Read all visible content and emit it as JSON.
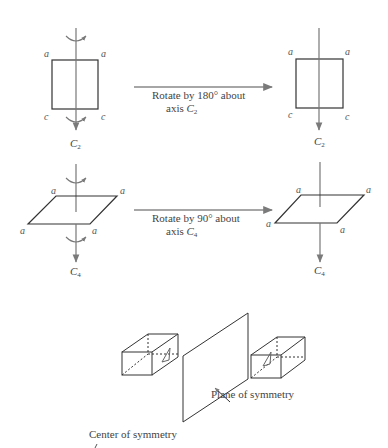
{
  "figure": {
    "c2_row": {
      "before_labels": {
        "top_left": "a",
        "top_right": "a",
        "bottom_left": "c",
        "bottom_right": "c"
      },
      "after_labels": {
        "top_left": "a",
        "top_right": "a",
        "bottom_left": "c",
        "bottom_right": "c"
      },
      "arrow_caption_line1": "Rotate by 180° about",
      "arrow_caption_line2_prefix": "axis ",
      "axis_name": "C",
      "axis_subscript": "2"
    },
    "c4_row": {
      "before_labels": {
        "top_left": "a",
        "top_right": "a",
        "bottom_left": "a",
        "bottom_right": "a"
      },
      "after_labels": {
        "top_left": "a",
        "top_right": "a",
        "bottom_left": "a",
        "bottom_right": "a"
      },
      "arrow_caption_line1": "Rotate by 90° about",
      "arrow_caption_line2_prefix": "axis ",
      "axis_name": "C",
      "axis_subscript": "4"
    },
    "plane_section": {
      "caption": "Plane of symmetry"
    },
    "center_section": {
      "caption": "Center of symmetry"
    },
    "colors": {
      "line": "#333333",
      "arrow": "#8a8a8a"
    }
  }
}
